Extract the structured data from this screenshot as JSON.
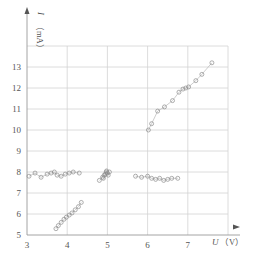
{
  "chart_data": {
    "type": "scatter",
    "title": "",
    "xlabel": "U（V）",
    "ylabel": "I（mA）",
    "xlabel_var": "U",
    "xlabel_unit": "（V）",
    "ylabel_var": "I",
    "ylabel_unit": "（mA）",
    "xlim": [
      3,
      8
    ],
    "ylim": [
      5,
      14
    ],
    "x_ticks": [
      3,
      4,
      5,
      6,
      7
    ],
    "y_ticks": [
      5,
      6,
      7,
      8,
      9,
      10,
      11,
      12,
      13
    ],
    "grid": true,
    "legend": null,
    "series": [
      {
        "name": "cluster-flat-left",
        "x": [
          3.05,
          3.2,
          3.35,
          3.5,
          3.6,
          3.68,
          3.75,
          3.85,
          3.95,
          4.05,
          4.15,
          4.3
        ],
        "y": [
          7.8,
          7.95,
          7.75,
          7.9,
          7.95,
          8.0,
          7.85,
          7.8,
          7.9,
          7.95,
          8.0,
          7.95
        ]
      },
      {
        "name": "cluster-near-5V",
        "x": [
          4.8,
          4.88,
          4.92,
          4.95,
          4.97,
          5.0,
          5.02,
          5.05,
          4.9,
          4.98
        ],
        "y": [
          7.6,
          7.75,
          7.85,
          7.9,
          8.0,
          7.95,
          7.85,
          8.0,
          7.7,
          8.05
        ]
      },
      {
        "name": "cluster-flat-right",
        "x": [
          5.7,
          5.85,
          6.0,
          6.1,
          6.2,
          6.3,
          6.4,
          6.5,
          6.6,
          6.75
        ],
        "y": [
          7.8,
          7.75,
          7.8,
          7.7,
          7.65,
          7.7,
          7.6,
          7.65,
          7.7,
          7.7
        ]
      },
      {
        "name": "rising-low",
        "x": [
          3.72,
          3.78,
          3.85,
          3.92,
          3.98,
          4.05,
          4.12,
          4.2,
          4.28,
          4.35
        ],
        "y": [
          5.3,
          5.45,
          5.6,
          5.75,
          5.85,
          5.95,
          6.05,
          6.2,
          6.35,
          6.55
        ]
      },
      {
        "name": "rising-high",
        "x": [
          6.02,
          6.1,
          6.25,
          6.42,
          6.62,
          6.78,
          6.88,
          6.95,
          7.02,
          7.2,
          7.35,
          7.6
        ],
        "y": [
          10.0,
          10.3,
          10.9,
          11.1,
          11.4,
          11.8,
          11.95,
          12.0,
          12.05,
          12.35,
          12.65,
          13.2
        ]
      }
    ]
  }
}
